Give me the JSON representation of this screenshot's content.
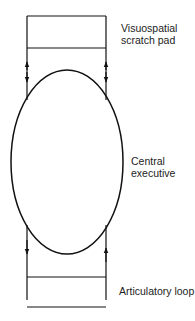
{
  "diagram": {
    "title": "",
    "nodes": [
      {
        "id": "visuospatial",
        "shape": "rectangle",
        "label_lines": [
          "Visuospatial",
          "scratch pad"
        ]
      },
      {
        "id": "central",
        "shape": "ellipse",
        "label_lines": [
          "Central",
          "executive"
        ]
      },
      {
        "id": "articulatory",
        "shape": "rectangle",
        "label_lines": [
          "Articulatory loop"
        ]
      }
    ],
    "edges": [
      {
        "from": "central",
        "to": "visuospatial",
        "direction": "bidirectional",
        "side": "left"
      },
      {
        "from": "central",
        "to": "visuospatial",
        "direction": "bidirectional",
        "side": "right"
      },
      {
        "from": "central",
        "to": "articulatory",
        "direction": "down",
        "side": "left"
      },
      {
        "from": "articulatory",
        "to": "central",
        "direction": "up",
        "side": "right"
      }
    ],
    "colors": {
      "stroke": "#111111",
      "background": "#ffffff"
    }
  }
}
